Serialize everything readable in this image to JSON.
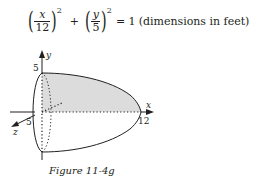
{
  "equation": {
    "term1": {
      "numerator": "x",
      "denominator": "12",
      "exponent": "2"
    },
    "operator": "+",
    "term2": {
      "numerator": "y",
      "denominator": "5",
      "exponent": "2"
    },
    "rhs": "= 1",
    "note": "(dimensions in feet)"
  },
  "figure": {
    "axis_labels": {
      "x": "x",
      "y": "y",
      "z": "z"
    },
    "tick_labels": {
      "y_top": "5",
      "z_near": "5",
      "x_end": "12"
    },
    "shape": "half-ellipsoid of revolution about x-axis",
    "semi_axes": {
      "x": 12,
      "y": 5
    },
    "shaded_region": "upper half cross-section (x from 0 to 12, y from 0 to 5)",
    "colors": {
      "line": "#231f20",
      "shading": "#dcdcdc"
    }
  },
  "caption": "Figure 11-4g"
}
